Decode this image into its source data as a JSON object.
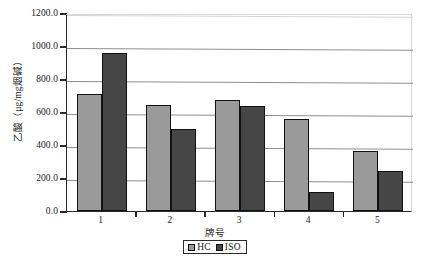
{
  "chart_data": {
    "type": "bar",
    "title": "",
    "xlabel": "牌号",
    "ylabel": "乙酸（μg/mg烟碱）",
    "categories": [
      "1",
      "2",
      "3",
      "4",
      "5"
    ],
    "series": [
      {
        "name": "HC",
        "color": "#9a9a9a",
        "values": [
          712,
          640,
          672,
          555,
          365
        ]
      },
      {
        "name": "ISO",
        "color": "#464646",
        "values": [
          960,
          500,
          635,
          115,
          245
        ]
      }
    ],
    "ylim": [
      0,
      1200
    ],
    "ytick_labels": [
      "1200.0",
      "1000.0",
      "800.0",
      "600.0",
      "400.0",
      "200.0",
      "0.0"
    ],
    "ytick_values": [
      1200,
      1000,
      800,
      600,
      400,
      200,
      0
    ],
    "grid": true,
    "legend_position": "bottom",
    "legend_entries": [
      {
        "label": "HC",
        "swatch": "hc"
      },
      {
        "label": "ISO",
        "swatch": "iso"
      }
    ]
  }
}
